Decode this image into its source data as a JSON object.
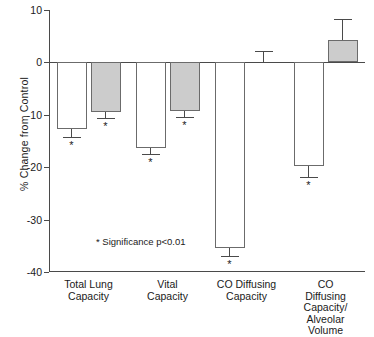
{
  "chart_data": {
    "type": "bar",
    "title": "",
    "xlabel": "",
    "ylabel": "% Change from Control",
    "ylim": [
      -40,
      10
    ],
    "yticks": [
      10,
      0,
      -10,
      -20,
      -30,
      -40
    ],
    "ytick_labels": [
      "10",
      "0",
      "-10",
      "-20",
      "-30",
      "-40"
    ],
    "grid": false,
    "legend": "none",
    "annotation": "* Significance p<0.01",
    "significance_marker": "*",
    "categories": [
      "Total Lung\nCapacity",
      "Vital\nCapacity",
      "CO Diffusing\nCapacity",
      "CO Diffusing\nCapacity/\nAlveolar Volume"
    ],
    "series": [
      {
        "name": "open",
        "fill": "#ffffff",
        "values": [
          -12.8,
          -16.3,
          -35.5,
          -19.8
        ],
        "errors": [
          1.4,
          1.2,
          1.5,
          2.0
        ],
        "significant": [
          true,
          true,
          true,
          true
        ]
      },
      {
        "name": "filled",
        "fill": "#cccccc",
        "values": [
          -9.5,
          -9.3,
          0.0,
          4.2
        ],
        "errors": [
          1.2,
          1.2,
          2.2,
          4.0
        ],
        "significant": [
          true,
          true,
          false,
          false
        ]
      }
    ]
  },
  "colors": {
    "axis": "#4a4a4a",
    "bar_edge": "#6b6b6b",
    "open_fill": "#ffffff",
    "filled_fill": "#cccccc",
    "text": "#1a1a1a"
  }
}
